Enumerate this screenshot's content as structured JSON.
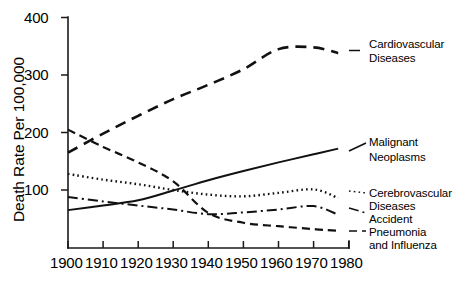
{
  "chart_data": {
    "type": "line",
    "title": "",
    "xlabel": "",
    "ylabel": "Death Rate Per 100,000",
    "xlim": [
      1900,
      1980
    ],
    "ylim": [
      0,
      400
    ],
    "xticks": [
      1900,
      1910,
      1920,
      1930,
      1940,
      1950,
      1960,
      1970,
      1980
    ],
    "xtick_labels": [
      "1900",
      "1910",
      "1920",
      "1930",
      "1940",
      "1950",
      "1960",
      "1970",
      "1980"
    ],
    "yticks": [
      100,
      200,
      300,
      400
    ],
    "ytick_labels": [
      "100",
      "200",
      "300",
      "400"
    ],
    "grid": false,
    "legend_position": "right-inline-labels",
    "x": [
      1900,
      1910,
      1920,
      1930,
      1940,
      1950,
      1960,
      1970,
      1977
    ],
    "series": [
      {
        "name": "Cardiovascular Diseases",
        "label_lines": [
          "Cardiovascular",
          "Diseases"
        ],
        "style": "long-dash",
        "dasharray": "11,7",
        "width": 2.6,
        "values": [
          165,
          198,
          229,
          258,
          283,
          310,
          345,
          348,
          338
        ]
      },
      {
        "name": "Malignant Neoplasms",
        "label_lines": [
          "Malignant",
          "Neoplasms"
        ],
        "style": "solid",
        "dasharray": "none",
        "width": 2.0,
        "values": [
          65,
          73,
          82,
          99,
          117,
          133,
          148,
          162,
          172
        ]
      },
      {
        "name": "Cerebrovascular Diseases",
        "label_lines": [
          "Cerebrovascular",
          "Diseases"
        ],
        "style": "dotted",
        "dasharray": "1.6,3.2",
        "width": 2.4,
        "values": [
          128,
          118,
          110,
          100,
          92,
          89,
          95,
          101,
          86
        ]
      },
      {
        "name": "Accident",
        "label_lines": [
          "Accident"
        ],
        "style": "dash-dot",
        "dasharray": "10,4,2,4",
        "width": 2.0,
        "values": [
          88,
          80,
          73,
          66,
          58,
          61,
          66,
          72,
          57
        ]
      },
      {
        "name": "Pneumonia and Influenza",
        "label_lines": [
          "Pneumonia",
          "and Influenza"
        ],
        "style": "dash",
        "dasharray": "8,5",
        "width": 2.2,
        "values": [
          205,
          175,
          148,
          115,
          60,
          43,
          37,
          32,
          29
        ]
      }
    ]
  },
  "axis": {
    "y_title": "Death Rate Per 100,000"
  },
  "labels": {
    "cardiovascular_line1": "Cardiovascular",
    "cardiovascular_line2": "Diseases",
    "malignant_line1": "Malignant",
    "malignant_line2": "Neoplasms",
    "cerebrovascular_line1": "Cerebrovascular",
    "cerebrovascular_line2": "Diseases",
    "accident_line1": "Accident",
    "pneumonia_line1": "Pneumonia",
    "pneumonia_line2": "and Influenza"
  },
  "ticks": {
    "y": [
      "400",
      "300",
      "200",
      "100"
    ],
    "x": [
      "1900",
      "1910",
      "1920",
      "1930",
      "1940",
      "1950",
      "1960",
      "1970",
      "1980"
    ]
  }
}
